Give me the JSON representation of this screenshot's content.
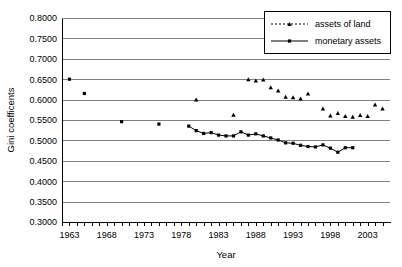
{
  "chart_data": {
    "type": "scatter",
    "title": "",
    "xlabel": "Year",
    "ylabel": "Gini coefficents",
    "xlim": [
      1962,
      2006
    ],
    "ylim": [
      0.3,
      0.8
    ],
    "grid": true,
    "legend_position": "top-right",
    "y_ticks": [
      "0.3000",
      "0.3500",
      "0.4000",
      "0.4500",
      "0.5000",
      "0.5500",
      "0.6000",
      "0.6500",
      "0.7000",
      "0.7500",
      "0.8000"
    ],
    "y_tick_values": [
      0.3,
      0.35,
      0.4,
      0.45,
      0.5,
      0.55,
      0.6,
      0.65,
      0.7,
      0.75,
      0.8
    ],
    "x_ticks": [
      "1963",
      "1968",
      "1973",
      "1978",
      "1983",
      "1988",
      "1993",
      "1998",
      "2003"
    ],
    "x_tick_values": [
      1963,
      1968,
      1973,
      1978,
      1983,
      1988,
      1993,
      1998,
      2003
    ],
    "x_minor_tick_step": 1,
    "series": [
      {
        "name": "assets of land",
        "marker": "triangle",
        "line_style": "dashed",
        "connected": false,
        "color": "#000000",
        "x": [
          1980,
          1985,
          1987,
          1988,
          1989,
          1990,
          1991,
          1992,
          1993,
          1994,
          1995,
          1997,
          1998,
          1999,
          2000,
          2001,
          2002,
          2003,
          2004,
          2005
        ],
        "values": [
          0.6,
          0.563,
          0.65,
          0.647,
          0.649,
          0.63,
          0.622,
          0.607,
          0.606,
          0.603,
          0.615,
          0.578,
          0.561,
          0.567,
          0.56,
          0.558,
          0.562,
          0.56,
          0.588,
          0.578
        ]
      },
      {
        "name": "monetary assets",
        "marker": "square",
        "line_style": "solid",
        "connected": true,
        "color": "#000000",
        "x": [
          1963,
          1965,
          1970,
          1975,
          1979,
          1980,
          1981,
          1982,
          1983,
          1984,
          1985,
          1986,
          1987,
          1988,
          1989,
          1990,
          1991,
          1992,
          1993,
          1994,
          1995,
          1996,
          1997,
          1998,
          1999,
          2000,
          2001
        ],
        "values": [
          0.65,
          0.615,
          0.546,
          0.54,
          0.535,
          0.524,
          0.517,
          0.519,
          0.513,
          0.511,
          0.511,
          0.521,
          0.513,
          0.516,
          0.511,
          0.506,
          0.501,
          0.494,
          0.493,
          0.488,
          0.485,
          0.484,
          0.489,
          0.481,
          0.471,
          0.482,
          0.482
        ]
      }
    ]
  },
  "legend": {
    "items": [
      {
        "label": "assets of land"
      },
      {
        "label": "monetary assets"
      }
    ]
  }
}
